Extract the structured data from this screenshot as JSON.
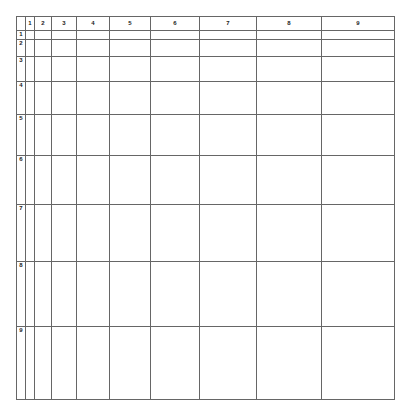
{
  "figure": {
    "name": "multiplication-dot-array-grid",
    "rows": 9,
    "columns": 9,
    "corner_label": "",
    "column_headers": [
      "1",
      "2",
      "3",
      "4",
      "5",
      "6",
      "7",
      "8",
      "9"
    ],
    "row_headers": [
      "1",
      "2",
      "3",
      "4",
      "5",
      "6",
      "7",
      "8",
      "9"
    ]
  },
  "style": {
    "dot_color": "#555555",
    "grid_line_color": "#666666",
    "inner_line_color": "#d8d8d8",
    "background_color": "#ffffff",
    "dot_pitch_px": 8,
    "dot_diameter_px": 4
  },
  "chart_data": {
    "type": "table",
    "title": "",
    "xlabel": "",
    "ylabel": "",
    "categories": [
      "1",
      "2",
      "3",
      "4",
      "5",
      "6",
      "7",
      "8",
      "9"
    ],
    "row_categories": [
      "1",
      "2",
      "3",
      "4",
      "5",
      "6",
      "7",
      "8",
      "9"
    ],
    "series": [
      {
        "name": "1",
        "values": [
          1,
          2,
          3,
          4,
          5,
          6,
          7,
          8,
          9
        ]
      },
      {
        "name": "2",
        "values": [
          2,
          4,
          6,
          8,
          10,
          12,
          14,
          16,
          18
        ]
      },
      {
        "name": "3",
        "values": [
          3,
          6,
          9,
          12,
          15,
          18,
          21,
          24,
          27
        ]
      },
      {
        "name": "4",
        "values": [
          4,
          8,
          12,
          16,
          20,
          24,
          28,
          32,
          36
        ]
      },
      {
        "name": "5",
        "values": [
          5,
          10,
          15,
          20,
          25,
          30,
          35,
          40,
          45
        ]
      },
      {
        "name": "6",
        "values": [
          6,
          12,
          18,
          24,
          30,
          36,
          42,
          48,
          54
        ]
      },
      {
        "name": "7",
        "values": [
          7,
          14,
          21,
          28,
          35,
          42,
          49,
          56,
          63
        ]
      },
      {
        "name": "8",
        "values": [
          8,
          16,
          24,
          32,
          40,
          48,
          56,
          64,
          72
        ]
      },
      {
        "name": "9",
        "values": [
          9,
          18,
          27,
          36,
          45,
          54,
          63,
          72,
          81
        ]
      }
    ]
  }
}
